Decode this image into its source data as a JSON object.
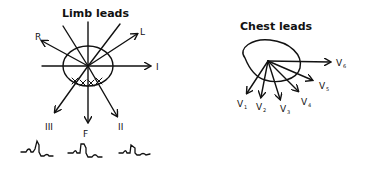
{
  "limb": {
    "title": "Limb leads",
    "labels": {
      "R": "R",
      "L": "L",
      "I": "I",
      "III": "III",
      "F": "F",
      "II": "II"
    }
  },
  "chest": {
    "title": "Chest leads",
    "labels": [
      {
        "base": "V",
        "sub": "1"
      },
      {
        "base": "V",
        "sub": "2"
      },
      {
        "base": "V",
        "sub": "3"
      },
      {
        "base": "V",
        "sub": "4"
      },
      {
        "base": "V",
        "sub": "5"
      },
      {
        "base": "V",
        "sub": "6"
      }
    ]
  }
}
